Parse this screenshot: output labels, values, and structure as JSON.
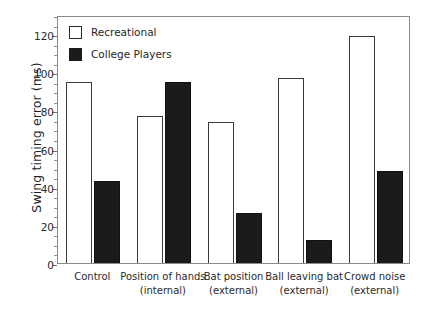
{
  "chart_data": {
    "type": "bar",
    "title": "",
    "xlabel": "",
    "ylabel": "Swing timing error (ms)",
    "ylim": [
      0,
      130
    ],
    "ytick_values": [
      0,
      20,
      40,
      60,
      80,
      100,
      120
    ],
    "ytick_labels": [
      "0",
      "20",
      "40",
      "60",
      "80",
      "100",
      "120"
    ],
    "yminor_step": 5,
    "grid": false,
    "legend_position": "upper-left-inside",
    "categories": [
      "Control",
      "Position of hands (internal)",
      "Bat position (external)",
      "Ball leaving bat (external)",
      "Crowd noise (external)"
    ],
    "category_lines": [
      [
        "Control",
        ""
      ],
      [
        "Position of hands",
        "(internal)"
      ],
      [
        "Bat position",
        "(external)"
      ],
      [
        "Ball leaving bat",
        "(external)"
      ],
      [
        "Crowd noise",
        "(external)"
      ]
    ],
    "series": [
      {
        "name": "Recreational",
        "style": "open",
        "color": "#ffffff",
        "edge_color": "#3a3a3a",
        "values": [
          95,
          77,
          74,
          97,
          119
        ]
      },
      {
        "name": "College Players",
        "style": "filled",
        "color": "#1b1b1b",
        "edge_color": "#111111",
        "values": [
          43,
          95,
          26,
          12,
          48
        ]
      }
    ]
  },
  "legend": {
    "items": [
      {
        "label": "Recreational",
        "style": "open"
      },
      {
        "label": "College Players",
        "style": "filled"
      }
    ]
  }
}
